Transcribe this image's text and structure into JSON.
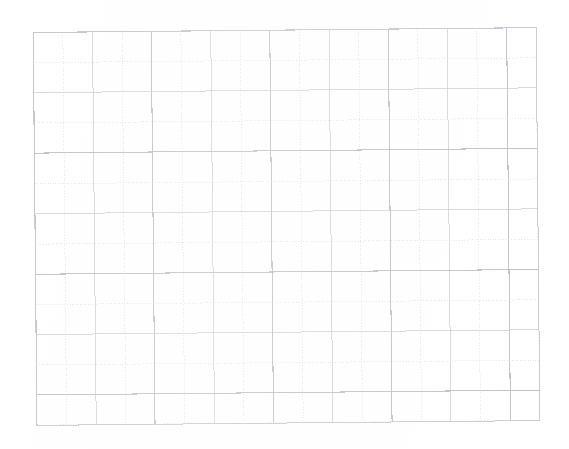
{
  "image": {
    "kind": "scanned-graph-paper",
    "description": "Scanned sheet of blank square graph paper",
    "width": 569,
    "height": 449,
    "background_color": "#ffffff"
  },
  "grid": {
    "label": "graph-paper-grid",
    "origin_x": 35,
    "origin_y": 30,
    "width": 503,
    "height": 393,
    "columns": 17,
    "rows": 13,
    "cell_size": 29.6,
    "rotation_deg": -0.55,
    "line_color_solid": "#c9cbd0",
    "line_color_dotted": "#d6d8dd",
    "line_color_major": "#b9bcc3",
    "border_color": "#c2c5cb",
    "solid_line_width": 0.9,
    "dotted_line_width": 0.8,
    "dot_dash_pattern": "1 1.6",
    "major_every_columns": 4,
    "major_every_rows": 4
  },
  "annotations": {
    "content_text": "",
    "has_text": false,
    "has_drawing": false,
    "note": "blank grid, no markings"
  }
}
